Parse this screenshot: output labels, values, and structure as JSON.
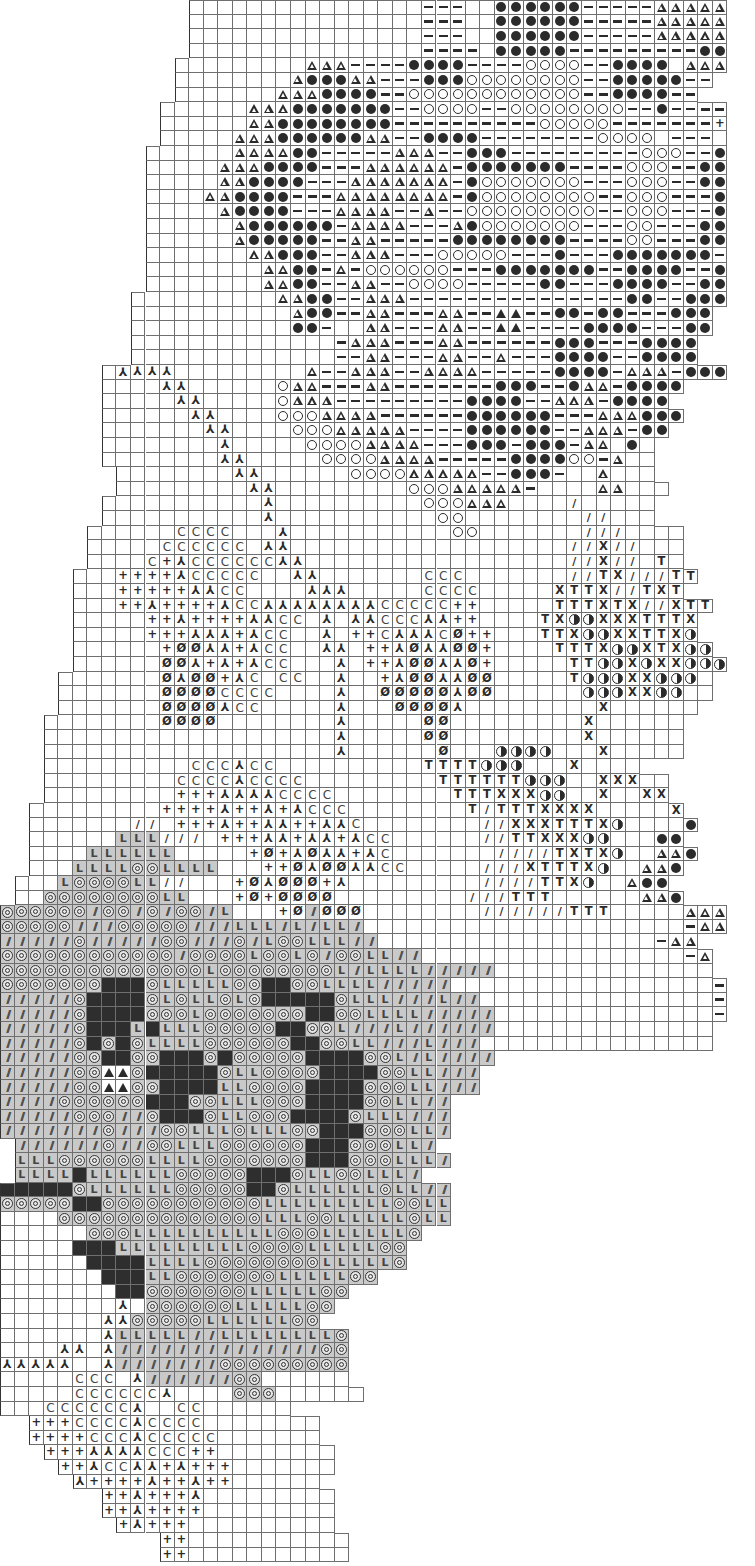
{
  "chart_data": {
    "type": "table",
    "title": "",
    "cell_size_px": [
      14.55,
      14.6
    ],
    "columns": 50,
    "rows_count": 104,
    "legend": {
      " ": "outside grid",
      ".": "empty",
      "-": "dash",
      "a": "open triangle",
      "A": "filled triangle",
      "o": "filled circle",
      "O": "open circle",
      "c": "letter C",
      "k": "sideways Y stitch",
      "+": "plus",
      "z": "slashed zero",
      "/": "single slash",
      "T": "letter T",
      "x": "letter X",
      "h": "half-filled circle",
      "=": "double slash (shaded)",
      "@": "bullseye (shaded)",
      "L": "letter L (shaded)",
      "#": "solid black",
      "G": "shaded empty"
    },
    "rows": [
      "             ................---..oooooo-----aaaaaaaa-",
      "             ................---..oooooo-----aaaaaaaa-",
      "             ................---..oooooo-----aaaaaaaa-",
      "             ................----.ooooo---------ooaaa-",
      "            .........aaa----oooo----OOOO--oooo.aaa-",
      "            ........aoooaa---oooOOOOOOOO--ooooo--",
      "            .......aaaoooo--OOOOOOOOOOOO--oooo--",
      "           ......aaaooooooo--OOOO--OOOOOOOO--o----",
      "           ......aaoooooooo----------OOOOO-------+",
      "           .....aaaooooooaa--oooo--------OOOO.---.+",
      "          ......aaaaoo-----aaa--ooo---------OOO--o-",
      "          .....aaaoooo---aaaaaa-ooooooo----OOO--oo-",
      "          .....aaoooo---aaaaaaa-oOOOOOOO---OOO--oo-",
      "          ....aaoooo---aaaaaaaa-oOOOOOOOO--OOO---oo",
      "          .....aoooo---aaaa--a--OOOOOOOOO--OOO---oo",
      "          ......aoooooo-aaaa---aoOOOOOOO---OO---oo-",
      "          ......aooooo--aa-----oooooooo----OO---ooo",
      "          .......aaooo--aaa---OOOOO---o---ooooooo-",
      "          ........aaoo-a-OOOOOO---ooooooo--oooo--o",
      "          ........aaoo--aa--OOOO-----oo---oooo--oo",
      "         ..........aaoo--aaa---------------oo--ooo",
      "         ...........aoo--aa---aa--AA--oo-oo---ooo",
      "         ...........oo-..aa---aa--AA----oooo---oo",
      "         ..............-aaa---aa------ooo---oooo",
      "         ..............--aa---aa--a---oooo--oooo",
      "       .kkkk.........a--aaa--aaaa-----oooo-aaa-ooo",
      "       ....kk......Oaa---aa-------ooo--oaa-oooo",
      "       .....kk.....Oaaa---------oooo--aaa-oooo",
      "       ......kk....OOOaaaa------oooooo---aaaooo",
      "       .......kk....OOOaaaaa----oooooo--aaa-oo",
      "       ........k.....OOOOaaaa---ooo-ooo-aa.o.",
      "       ........kk.....OOOOaaaa-----ooooOO-a..",
      "        ........kk......OOOOaaaaa--ooo-..a...",
      "        .........kk.........OOOaaaaa-....aa...",
      "       ...........k..........OOOaaa..../.....",
      "       ...........k...........OO........//...",
      "      ......cccc...k...........OO.......///....",
      "      .....cccccc.kk...................//x//...",
      "      ....c+kcccccckk..................//x//.T.",
      "     ...++++kccccc..kk.......ccc.......//Tx///TT",
      "     ...+++++kkcc....kkk.....cccc.....xTTx//TxT",
      "     ...++k++++kcckkkkkkkkccccc++.....TTTxTx//xTT",
      "     .....++k++++kkcc.k.kkccckk++....TxhhxxxTTTx",
      "     .....+++kkk+kcc..k.++ckkkcz++...TTxhhxxTTxh",
      "     ......+zzkk+kcc..kk.++kzkkzz+....TTTxhhxTxhh",
      "     ......zzk+k+kcc...k.++kzzkkz+.....TThhxhxxhhh",
      "    .......zkzz+kc.cc..k..+kzzkkzz.....Thhhxxhhh.",
      "    .......zzzzcccc....k..zzzzzkzz......hhhxxhh..",
      "    .......zzzzkcc.....k...zzzzk.........x......",
      "   ........zzzz........k.....zz.........x......",
      "   ....................k.....zz.........x......",
      "   ....................k......z...hhhh...x.....",
      "   ..........ccckcc..........TTTThhh...x....",
      "   .........cccckcccc.........TTTTTThhh..xxx..",
      "   .........+++kkkkcccc........TTTxxxhh..x..xx",
      "  .........++++k++k+kccc........T/TTTxxxx.....x",
      "  .......//.+++k++kk++kkc........//xxxTTTxh....o",
      "  ......LLL///.+++kk+kk+kcc......//TTxxxhh...oo",
      "  ....LLLLLL.....+z+kzkk+kc.......////TxTxh..aao",
      "  ...LLLL@@LLLL...++zkzzkkcc.....///xTTTxh..aao",
      " ...L@@@@LL//...+zkzzz+k.........////TTxh..aoo",
      " ..@@@@@@@@LL...+z+zzzz.........///TTT......aao",
      "@@@@@@=@@=@=@@=L...+z=zzz........//////TTT.....aaa",
      "@@@@@===@@@@@===LLL=L=LL=......................-aaa",
      "=====@=====@@===@=L@@LLL==...................-aa",
      "@@@@@@@@@@@@=@@@@L@@L@=@@LL==..................-a",
      "@@@@@@@@@@@@@@L@@@@@@@@L=LLLL=====...............",
      "@@@@@@@###@LLLLL@@##@@LLLL=====..................-",
      "=====@####@L@LL@L@#####@LLL===L==................-",
      "=====@####@@@L@@@@@@@##@@LLLL=====...............-",
      "=====@###L#LLL@@@@@##@@L===L======...............",
      "=====@#@#@LLLL@@@@@@##@@LL===L===................",
      "=====@@##@@###@#@@@@@####@@L=L====",
      "=====@@AA@#####@LL@@@@####@@LL===",
      "=====@@AA@@####LL@@@@####@@@LL===",
      "====@@@@@@###@@LLL@@@####@@LL==",
      "=====@@@==@###@LL@@@####@LLL===",
      "=======@===@@LLL@LLL@@###@@@LL=",
      " ======@==@@LLL@@@@@@###@@@LL=",
      " LLL@@@@@@LLLL@@@@@@@###@@@LLL=",
      " LLLL#LLLLLL@@@@@###@LL@@LLL=",
      "#####@LLLLLL@@@@@##@LLLLLL@LL==",
      "@@@@@##@@@@@@@@@@@LLLLLLLLL@@LL",
      "....@@@@@@@@@@@@@@LLL@@LLLLL@LL",
      "......@@@LLLLLLLLLL@@@LLLLLL@",
      ".....###LLLLLLLLL@@@@LLLLL@@",
      "......####LLLL@@@@@@@@LLLLL@",
      ".......###LL@@@@@@@LLLLL@@",
      "........##@@@@@@@LLLLL@@",
      "........k.@@@@@@LLLLL@@",
      ".......kk@@@@@LLLLLL@@",
      ".......kLLLLL==LLLLLLLL@",
      "....kk.k==============@@",
      "kkkkk..k=======@@@@@@@@@",
      ".....ccc.k======@@......",
      ".....cccccck....@@@......",
      "...cccccck..cc......",
      "  +++cccckcccc........",
      "  ++++ccckccccc.......",
      "   +++kkkkccc++........",
      "    ++kcckk+k+++.......",
      "     k++++k++k++......",
      "       ++k+++k.........",
      "       ++k++++.........",
      "        +k+++..........",
      "           ++...........",
      "           ++..........."
    ]
  }
}
